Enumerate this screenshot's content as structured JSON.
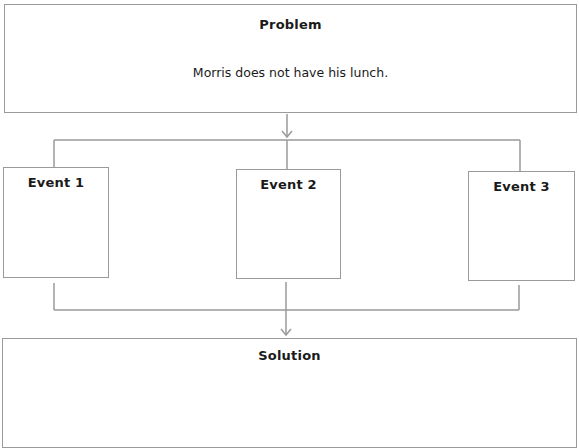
{
  "problem": {
    "title": "Problem",
    "text": "Morris does not have his lunch."
  },
  "events": [
    {
      "title": "Event 1",
      "text": ""
    },
    {
      "title": "Event 2",
      "text": ""
    },
    {
      "title": "Event 3",
      "text": ""
    }
  ],
  "solution": {
    "title": "Solution",
    "text": ""
  },
  "colors": {
    "border": "#9a9a9a",
    "text": "#1a1a1a",
    "background": "#ffffff"
  }
}
